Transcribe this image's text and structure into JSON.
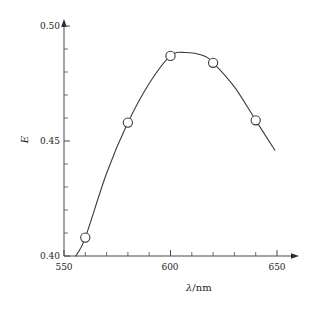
{
  "figure": {
    "background_color": "#ffffff",
    "line_color": "#3a3a3a",
    "axis_color": "#4a4a4a",
    "marker_fill": "#ffffff",
    "marker_stroke": "#3a3a3a"
  },
  "axes": {
    "x": {
      "title_variable": "λ",
      "title_separator": "/",
      "title_unit": "nm",
      "title_full": "λ/nm",
      "tick_labels": [
        "550",
        "600",
        "650"
      ],
      "tick_values": [
        550,
        600,
        650
      ],
      "minor_tick_values": [
        560,
        570,
        580,
        590,
        610,
        620,
        630,
        640
      ],
      "range": [
        550,
        655
      ],
      "has_arrow": true
    },
    "y": {
      "title_variable": "E",
      "title_full": "E",
      "tick_labels": [
        "0.40",
        "0.45",
        "0.50"
      ],
      "tick_values": [
        0.4,
        0.45,
        0.5
      ],
      "minor_tick_values": [
        0.41,
        0.42,
        0.43,
        0.44,
        0.46,
        0.47,
        0.48,
        0.49
      ],
      "range": [
        0.4,
        0.502
      ],
      "has_arrow": true
    }
  },
  "chart_data": {
    "type": "line",
    "title": "",
    "subtitle": "",
    "xlabel": "λ/nm",
    "ylabel": "E",
    "xlim": [
      550,
      655
    ],
    "ylim": [
      0.4,
      0.502
    ],
    "grid": false,
    "legend": null,
    "marker": "open-circle",
    "series": [
      {
        "name": "absorbance",
        "x": [
          560,
          580,
          600,
          620,
          640
        ],
        "values": [
          0.408,
          0.458,
          0.487,
          0.484,
          0.459
        ]
      }
    ],
    "curve": {
      "description": "smooth interpolating curve through the five measured points, extended beyond both end markers",
      "x": [
        555.5,
        560,
        570,
        580,
        590,
        600,
        607,
        615,
        620,
        630,
        640,
        649
      ],
      "y": [
        0.4,
        0.408,
        0.436,
        0.458,
        0.475,
        0.487,
        0.4885,
        0.4873,
        0.484,
        0.4735,
        0.459,
        0.446
      ]
    },
    "peak": {
      "x": 607,
      "y": 0.4885
    }
  }
}
